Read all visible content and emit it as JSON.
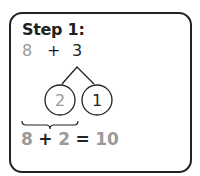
{
  "title": "Step 1:",
  "expression": {
    "left": "8",
    "operator": "+",
    "right": "3"
  },
  "number_bond": {
    "whole": "3",
    "parts": [
      "2",
      "1"
    ]
  },
  "result": {
    "a": "8",
    "op": "+",
    "b": "2",
    "eq": "=",
    "sum": "10"
  },
  "colors": {
    "ink": "#222222",
    "muted": "#9a9a9a"
  }
}
